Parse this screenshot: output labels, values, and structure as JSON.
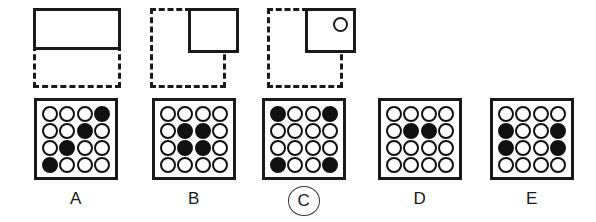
{
  "question": {
    "type": "visual-analogy-matrix",
    "prompt_figures": [
      {
        "id": "figure-1",
        "description": "solid wide rectangle on top half, dashed wide rectangle below",
        "outer_style": "dashed",
        "inner_style": "solid",
        "inner_position": "top-full-width",
        "has_circle_marker": false
      },
      {
        "id": "figure-2",
        "description": "dashed square with solid square in upper-right quadrant",
        "outer_style": "dashed",
        "inner_style": "solid",
        "inner_position": "top-right",
        "has_circle_marker": false
      },
      {
        "id": "figure-3",
        "description": "dashed square with solid square in upper-right quadrant containing a small open circle",
        "outer_style": "dashed",
        "inner_style": "solid",
        "inner_position": "top-right",
        "has_circle_marker": true,
        "circle_marker": "small-open-circle"
      }
    ],
    "options": [
      {
        "label": "A",
        "selected": false,
        "grid_rows": 4,
        "grid_cols": 4,
        "filled": [
          [
            false,
            false,
            false,
            true
          ],
          [
            false,
            false,
            true,
            false
          ],
          [
            false,
            true,
            false,
            false
          ],
          [
            true,
            false,
            false,
            false
          ]
        ]
      },
      {
        "label": "B",
        "selected": false,
        "grid_rows": 4,
        "grid_cols": 4,
        "filled": [
          [
            false,
            false,
            false,
            false
          ],
          [
            false,
            true,
            true,
            false
          ],
          [
            false,
            true,
            true,
            false
          ],
          [
            false,
            false,
            false,
            false
          ]
        ]
      },
      {
        "label": "C",
        "selected": true,
        "grid_rows": 4,
        "grid_cols": 4,
        "filled": [
          [
            true,
            false,
            false,
            true
          ],
          [
            false,
            false,
            false,
            false
          ],
          [
            false,
            false,
            false,
            false
          ],
          [
            true,
            false,
            false,
            true
          ]
        ]
      },
      {
        "label": "D",
        "selected": false,
        "grid_rows": 4,
        "grid_cols": 4,
        "filled": [
          [
            false,
            false,
            false,
            false
          ],
          [
            false,
            true,
            true,
            false
          ],
          [
            false,
            false,
            false,
            false
          ],
          [
            false,
            false,
            false,
            false
          ]
        ]
      },
      {
        "label": "E",
        "selected": false,
        "grid_rows": 4,
        "grid_cols": 4,
        "filled": [
          [
            false,
            false,
            false,
            false
          ],
          [
            true,
            false,
            false,
            true
          ],
          [
            true,
            false,
            false,
            true
          ],
          [
            false,
            false,
            false,
            false
          ]
        ]
      }
    ],
    "selected_answer": "C"
  },
  "colors": {
    "ink": "#1a1a1a",
    "dot_fill": "#111111",
    "background": "#ffffff",
    "selection_ring": "#3a3a3a"
  }
}
